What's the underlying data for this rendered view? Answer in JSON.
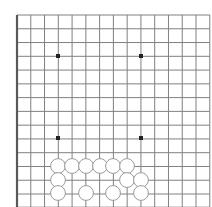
{
  "board": {
    "kind": "go-board-diagram",
    "title": "Go board position diagram",
    "background_color": "#ffffff",
    "grid": {
      "columns": 14,
      "rows": 14,
      "left_px": 17,
      "top_px": 15,
      "spacing_px": 13.77,
      "line_color": "#808080",
      "line_width": 1,
      "border_color": "#595959",
      "border_width": 2.2
    },
    "star_points": [
      {
        "name": "star-point-upper-left",
        "col": 3,
        "row": 3,
        "x": 58,
        "y": 56
      },
      {
        "name": "star-point-upper-right",
        "col": 9,
        "row": 3,
        "x": 141,
        "y": 56
      },
      {
        "name": "star-point-lower-left",
        "col": 3,
        "row": 9,
        "x": 58,
        "y": 138
      },
      {
        "name": "star-point-lower-right",
        "col": 9,
        "row": 9,
        "x": 141,
        "y": 138
      }
    ],
    "star_point_color": "#222222",
    "star_point_size": 4,
    "stones": [
      {
        "id": "stone-1",
        "color": "white",
        "col": 3,
        "row": 11,
        "x": 58,
        "y": 166
      },
      {
        "id": "stone-2",
        "color": "white",
        "col": 4,
        "row": 11,
        "x": 72,
        "y": 166
      },
      {
        "id": "stone-3",
        "color": "white",
        "col": 5,
        "row": 11,
        "x": 86,
        "y": 166
      },
      {
        "id": "stone-4",
        "color": "white",
        "col": 6,
        "row": 11,
        "x": 100,
        "y": 166
      },
      {
        "id": "stone-5",
        "color": "white",
        "col": 7,
        "row": 11,
        "x": 113,
        "y": 166
      },
      {
        "id": "stone-6",
        "color": "white",
        "col": 8,
        "row": 11,
        "x": 127,
        "y": 166
      },
      {
        "id": "stone-7",
        "color": "white",
        "col": 3,
        "row": 12,
        "x": 58,
        "y": 180
      },
      {
        "id": "stone-8",
        "color": "white",
        "col": 8,
        "row": 12,
        "x": 127,
        "y": 180
      },
      {
        "id": "stone-9",
        "color": "white",
        "col": 9,
        "row": 12,
        "x": 141,
        "y": 180
      },
      {
        "id": "stone-10",
        "color": "white",
        "col": 3,
        "row": 13,
        "x": 58,
        "y": 193
      },
      {
        "id": "stone-11",
        "color": "white",
        "col": 5,
        "row": 13,
        "x": 86,
        "y": 193
      },
      {
        "id": "stone-12",
        "color": "white",
        "col": 7,
        "row": 13,
        "x": 113,
        "y": 193
      },
      {
        "id": "stone-13",
        "color": "white",
        "col": 9,
        "row": 13,
        "x": 141,
        "y": 193
      }
    ],
    "stone_style": {
      "radius": 7.4,
      "white_fill": "#ffffff",
      "white_stroke": "#9a9a9a",
      "stroke_width": 1,
      "black_fill": "#1a1a1a",
      "black_stroke": "#000000"
    },
    "counts": {
      "white_stones": 13,
      "black_stones": 0,
      "star_points": 4
    }
  }
}
